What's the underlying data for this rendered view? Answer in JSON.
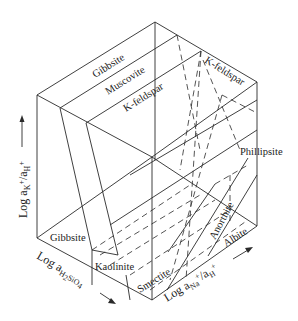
{
  "diagram": {
    "type": "3d-block-stability-diagram",
    "axes": {
      "vertical": {
        "label": "Log a",
        "sub1": "K",
        "sup1": "+",
        "slash": "/a",
        "sub2": "H",
        "sup2": "+",
        "arrow": "↑"
      },
      "left_depth": {
        "label": "Log a",
        "sub1": "H",
        "sub1b": "2",
        "sub1c": "SiO",
        "sub1d": "4",
        "arrow": "→"
      },
      "right_depth": {
        "label": "Log a",
        "sub1": "Na",
        "sup1": "+",
        "slash": "/a",
        "sub2": "H",
        "sup2": "+",
        "arrow": "→"
      }
    },
    "top_face_labels": [
      "Gibbsite",
      "Muscovite",
      "K-feldspar"
    ],
    "right_face_labels": [
      "K-feldspar",
      "Phillipsite"
    ],
    "bottom_face_labels": [
      "Gibbsite",
      "Kaolinite",
      "Smectite",
      "Anorthite",
      "Albite"
    ],
    "colors": {
      "line": "#2a2a2a",
      "text": "#222222",
      "background": "#ffffff"
    }
  }
}
